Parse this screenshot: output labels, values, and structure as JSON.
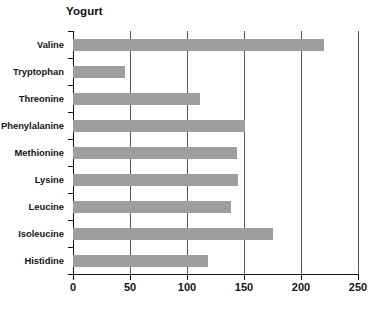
{
  "chart_data": {
    "type": "bar",
    "orientation": "horizontal",
    "title": "Yogurt",
    "xlabel": "",
    "ylabel": "",
    "categories": [
      "Valine",
      "Tryptophan",
      "Threonine",
      "Phenylalanine",
      "Methionine",
      "Lysine",
      "Leucine",
      "Isoleucine",
      "Histidine"
    ],
    "values": [
      220,
      46,
      111,
      151,
      144,
      145,
      139,
      175,
      118
    ],
    "xlim": [
      0,
      250
    ],
    "xticks": [
      0,
      50,
      100,
      150,
      200,
      250
    ],
    "grid": "vertical",
    "legend": "none",
    "bar_color": "#9e9e9e",
    "axis_color": "#111111",
    "gridline_color": "#555555"
  }
}
